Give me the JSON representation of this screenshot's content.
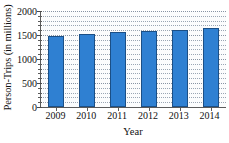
{
  "chart_data": {
    "type": "bar",
    "title": "",
    "xlabel": "Year",
    "ylabel": "Person-Trips (in millions)",
    "categories": [
      "2009",
      "2010",
      "2011",
      "2012",
      "2013",
      "2014"
    ],
    "values": [
      1470,
      1520,
      1555,
      1590,
      1610,
      1650
    ],
    "ylim": [
      0,
      2000
    ],
    "yticks": [
      0,
      500,
      1000,
      1500,
      2000
    ],
    "ytick_labels": [
      "0",
      "500",
      "1000",
      "1500",
      "2000"
    ],
    "y_minor_interval": 100,
    "grid": true,
    "grid_style": "dotted",
    "legend": null,
    "bar_color": "#2f80d2",
    "bar_edge_color": "#1b4f86",
    "plot_background": "#fbfcfd",
    "axis_color": "#5a5a5a",
    "gridline_color": "#8894a4"
  }
}
